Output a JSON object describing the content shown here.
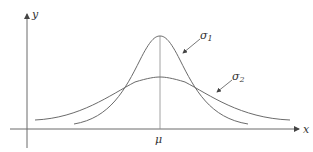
{
  "diagram": {
    "axes": {
      "x_label": "x",
      "y_label": "y",
      "mean_label": "μ"
    },
    "curves": [
      {
        "name": "narrow",
        "label_base": "σ",
        "label_sub": "1"
      },
      {
        "name": "wide",
        "label_base": "σ",
        "label_sub": "2"
      }
    ],
    "colors": {
      "line": "#6b6b6b",
      "text": "#333333"
    }
  }
}
